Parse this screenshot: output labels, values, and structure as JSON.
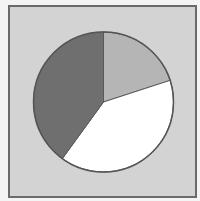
{
  "chart_data": {
    "type": "pie",
    "title": "",
    "legend": [],
    "center": [
      103.5,
      102
    ],
    "radius": 70,
    "start_angle_deg": -90,
    "direction": "clockwise",
    "slices": [
      {
        "label": "",
        "value": 20,
        "color": "#b5b5b5"
      },
      {
        "label": "",
        "value": 40,
        "color": "#ffffff"
      },
      {
        "label": "",
        "value": 40,
        "color": "#6f6f6f"
      }
    ]
  },
  "style": {
    "background": "#d3d3d3",
    "frame_border": "#6a6a6a",
    "outline": "#555555"
  }
}
